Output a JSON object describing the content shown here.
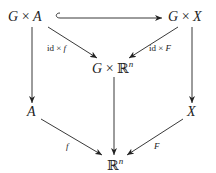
{
  "diagram": {
    "type": "commutative-diagram",
    "nodes": {
      "GxA": {
        "G": "G",
        "times": " × ",
        "A": "A"
      },
      "GxX": {
        "G": "G",
        "times": " × ",
        "X": "X"
      },
      "GxRn": {
        "G": "G",
        "times": " × ",
        "R": "ℝ",
        "exp": "n"
      },
      "A": {
        "label": "A"
      },
      "X": {
        "label": "X"
      },
      "Rn": {
        "R": "ℝ",
        "exp": "n"
      }
    },
    "edges": {
      "hook_GxA_GxX": {
        "from": "G × A",
        "to": "G × X",
        "style": "hook-inclusion",
        "label": ""
      },
      "GxA_to_GxRn": {
        "from": "G × A",
        "to": "G × ℝⁿ",
        "id": "id",
        "times": " × ",
        "fn": "f"
      },
      "GxX_to_GxRn": {
        "from": "G × X",
        "to": "G × ℝⁿ",
        "id": "id",
        "times": " × ",
        "fn": "F"
      },
      "GxA_to_A": {
        "from": "G × A",
        "to": "A",
        "label": ""
      },
      "GxX_to_X": {
        "from": "G × X",
        "to": "X",
        "label": ""
      },
      "GxRn_to_Rn": {
        "from": "G × ℝⁿ",
        "to": "ℝⁿ",
        "label": ""
      },
      "A_to_Rn": {
        "from": "A",
        "to": "ℝⁿ",
        "label": "f"
      },
      "X_to_Rn": {
        "from": "X",
        "to": "ℝⁿ",
        "label": "F"
      }
    },
    "colors": {
      "ink": "#222222",
      "background": "#ffffff"
    }
  }
}
